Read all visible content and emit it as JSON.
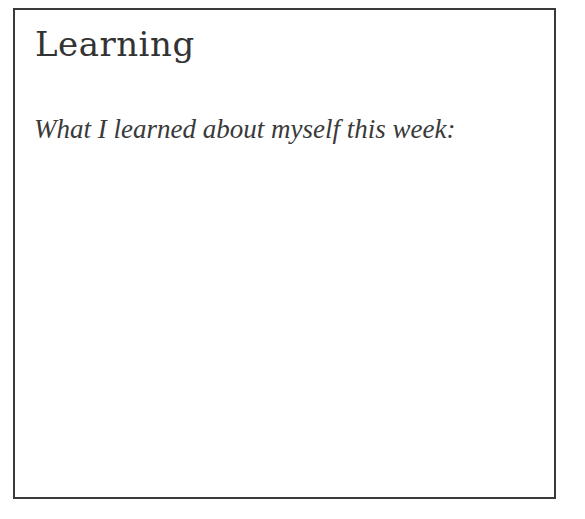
{
  "card": {
    "title": "Learning",
    "prompt": "What I learned about myself this week:",
    "response": ""
  },
  "colors": {
    "border": "#3a3a3a",
    "text": "#333333",
    "background": "#ffffff"
  }
}
